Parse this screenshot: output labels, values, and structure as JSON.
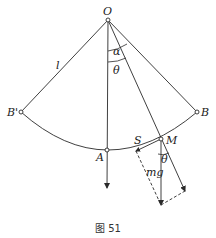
{
  "figure": {
    "caption": "图 51",
    "type": "pendulum force diagram"
  },
  "points": {
    "O": {
      "label": "O",
      "x": 108,
      "y": 20
    },
    "B_prime": {
      "label": "B'",
      "x": 21,
      "y": 112
    },
    "B": {
      "label": "B",
      "x": 197,
      "y": 112
    },
    "A": {
      "label": "A",
      "x": 107,
      "y": 150
    },
    "M": {
      "label": "M",
      "x": 161,
      "y": 139
    },
    "S": {
      "label": "S"
    }
  },
  "labels": {
    "length": "l",
    "alpha": "α",
    "theta_top": "θ",
    "theta_bottom": "θ",
    "weight": "mg",
    "O": "O",
    "B_prime": "B'",
    "B": "B",
    "A": "A",
    "M": "M",
    "S": "S"
  },
  "colors": {
    "line": "#2a2a2a",
    "background": "#ffffff"
  }
}
